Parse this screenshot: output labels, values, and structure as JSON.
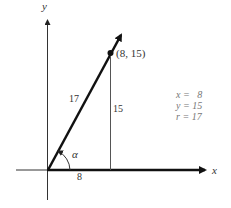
{
  "diagram": {
    "axes": {
      "x_label": "x",
      "y_label": "y"
    },
    "point": {
      "label": "(8, 15)",
      "x": 8,
      "y": 15
    },
    "segments": {
      "hypotenuse_label": "17",
      "vertical_label": "15",
      "horizontal_label": "8"
    },
    "angle": {
      "label": "α"
    },
    "values": {
      "x_line": "x =   8",
      "y_line": "y = 15",
      "r_line": "r = 17"
    },
    "colors": {
      "line": "#111111",
      "thin": "#555555",
      "text": "#333333"
    }
  }
}
